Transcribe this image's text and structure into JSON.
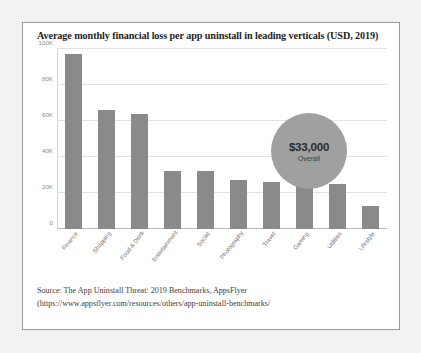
{
  "figure": {
    "title": "Average monthly financial loss per app uninstall in leading verticals (USD, 2019)",
    "background_color": "#ffffff",
    "border_color": "#9a9a9a",
    "page_background": "#f2f2f2"
  },
  "annotation": {
    "value": "$33,000",
    "caption": "Overall",
    "shape": "circle",
    "color": "#a0a0a0"
  },
  "source": {
    "line1": "Source: The  App Uninstall Threat: 2019 Benchmarks, AppsFlyer",
    "line2": "(https://www.appsflyer.com/resources/others/app-uninstall-benchmarks/"
  },
  "chart_data": {
    "type": "bar",
    "title": "Average monthly financial loss per app uninstall in leading verticals (USD, 2019)",
    "xlabel": "",
    "ylabel": "",
    "categories": [
      "Finance",
      "Shopping",
      "Food & Drink",
      "Entertainment",
      "Social",
      "Photography",
      "Travel",
      "Gaming",
      "Utilities",
      "Lifestyle"
    ],
    "values": [
      97000,
      66000,
      64000,
      32000,
      32000,
      27000,
      26000,
      26000,
      25000,
      13000
    ],
    "ylim": [
      0,
      100000
    ],
    "ytick_values": [
      0,
      20000,
      40000,
      60000,
      80000,
      100000
    ],
    "ytick_labels": [
      "0",
      "20K",
      "40K",
      "60K",
      "80K",
      "100K"
    ],
    "grid": true,
    "legend": false,
    "bar_color": "#8a8a8a",
    "overall_average": 33000
  }
}
